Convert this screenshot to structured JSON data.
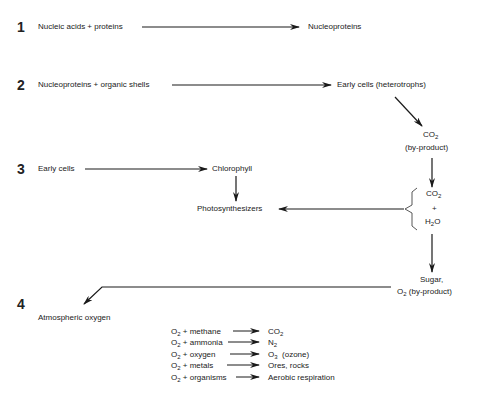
{
  "diagram": {
    "steps": [
      {
        "number": "1",
        "input": "Nucleic acids + proteins",
        "output": "Nucleoproteins"
      },
      {
        "number": "2",
        "input": "Nucleoproteins + organic shells",
        "output": "Early cells (heterotrophs)"
      },
      {
        "number": "3",
        "input": "Early cells",
        "output": "Chlorophyll",
        "result": "Photosynthesizers"
      },
      {
        "number": "4",
        "output": "Atmospheric oxygen"
      }
    ],
    "co2_byproduct": {
      "formula": "CO",
      "sub": "2",
      "note": "(by-product)"
    },
    "co2_h2o": {
      "co2": "CO",
      "co2_sub": "2",
      "plus": "+",
      "h": "H",
      "h_sub": "2",
      "o": "O"
    },
    "sugar_o2": {
      "sugar": "Sugar,",
      "o": "O",
      "o_sub": "2",
      "note": "(by-product)"
    },
    "reactions": [
      {
        "reactant_o": "O",
        "reactant_sub": "2",
        "reactant_rest": " + methane",
        "product": "CO",
        "product_sub": "2",
        "product_rest": ""
      },
      {
        "reactant_o": "O",
        "reactant_sub": "2",
        "reactant_rest": " + ammonia",
        "product": "N",
        "product_sub": "2",
        "product_rest": ""
      },
      {
        "reactant_o": "O",
        "reactant_sub": "2",
        "reactant_rest": " + oxygen",
        "product": "O",
        "product_sub": "3",
        "product_rest": "  (ozone)"
      },
      {
        "reactant_o": "O",
        "reactant_sub": "2",
        "reactant_rest": " + metals",
        "product": "Ores, rocks",
        "product_sub": "",
        "product_rest": ""
      },
      {
        "reactant_o": "O",
        "reactant_sub": "2",
        "reactant_rest": " + organisms",
        "product": "Aerobic respiration",
        "product_sub": "",
        "product_rest": ""
      }
    ],
    "colors": {
      "line": "#1a1a1a",
      "text": "#222222",
      "background": "#ffffff"
    }
  }
}
